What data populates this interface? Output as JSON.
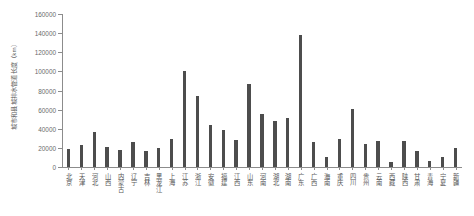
{
  "chart_data": {
    "type": "bar",
    "title": "",
    "xlabel": "",
    "ylabel": "城市和县城排水管道长度（km）",
    "ylim": [
      0,
      160000
    ],
    "ytick_values": [
      0,
      20000,
      40000,
      60000,
      80000,
      100000,
      120000,
      140000,
      160000
    ],
    "ytick_labels": [
      "0",
      "20000",
      "40000",
      "60000",
      "80000",
      "100000",
      "120000",
      "140000",
      "160000"
    ],
    "grid": false,
    "legend": false,
    "bar_color": "#4d4d4d",
    "axis_color": "#8c8c8c",
    "categories": [
      "北京",
      "天津",
      "河北",
      "山西",
      "内蒙古",
      "辽宁",
      "吉林",
      "黑龙江",
      "上海",
      "江苏",
      "浙江",
      "安徽",
      "福建",
      "江西",
      "山东",
      "河南",
      "湖北",
      "湖南",
      "广东",
      "广西",
      "海南",
      "重庆",
      "四川",
      "贵州",
      "云南",
      "西藏",
      "陕西",
      "甘肃",
      "青海",
      "宁夏",
      "新疆"
    ],
    "values": [
      18500,
      22500,
      36500,
      20500,
      18000,
      26000,
      16500,
      19500,
      29000,
      100000,
      74000,
      43500,
      38500,
      28000,
      87000,
      55000,
      48000,
      51000,
      138500,
      26500,
      10500,
      29000,
      61000,
      24000,
      27000,
      5500,
      27000,
      17000,
      6500,
      10500,
      19500
    ]
  }
}
